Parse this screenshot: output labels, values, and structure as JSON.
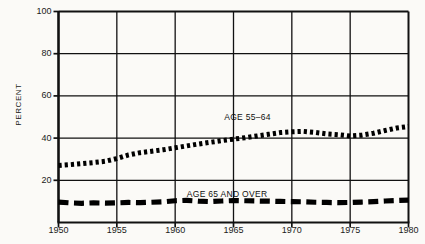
{
  "chart_data": {
    "type": "line",
    "title": "",
    "subtitle": "",
    "xlabel": "",
    "ylabel": "PERCENT",
    "xlim": [
      1950,
      1980
    ],
    "ylim": [
      0,
      100
    ],
    "grid": true,
    "legend_position": "inline-annotation",
    "y_ticks": [
      20,
      40,
      60,
      80,
      100
    ],
    "y_tick_labels": [
      "20",
      "40",
      "60",
      "80",
      "100"
    ],
    "x_ticks": [
      1950,
      1955,
      1960,
      1965,
      1970,
      1975,
      1980
    ],
    "x_tick_labels": [
      "1950",
      "1955",
      "1960",
      "1965",
      "1970",
      "1975",
      "1980"
    ],
    "x": [
      1950,
      1951,
      1952,
      1953,
      1954,
      1955,
      1956,
      1957,
      1958,
      1959,
      1960,
      1961,
      1962,
      1963,
      1964,
      1965,
      1966,
      1967,
      1968,
      1969,
      1970,
      1971,
      1972,
      1973,
      1974,
      1975,
      1976,
      1977,
      1978,
      1979,
      1980
    ],
    "series": [
      {
        "name": "AGE 55-64",
        "style": "dotted",
        "color": "#000000",
        "annotation": "AGE 55–64",
        "values": [
          27.0,
          27.4,
          27.9,
          28.4,
          29.0,
          30.3,
          32.0,
          33.1,
          33.8,
          34.5,
          35.4,
          36.3,
          37.2,
          38.0,
          38.8,
          39.5,
          40.2,
          41.0,
          41.8,
          42.6,
          43.0,
          43.2,
          42.7,
          42.0,
          41.6,
          41.0,
          41.4,
          42.3,
          43.6,
          44.8,
          45.5
        ]
      },
      {
        "name": "AGE 65 AND OVER",
        "style": "dashed",
        "color": "#000000",
        "annotation": "AGE 65 AND OVER",
        "values": [
          9.7,
          9.3,
          9.1,
          9.3,
          9.2,
          9.3,
          9.5,
          9.4,
          9.6,
          9.8,
          10.3,
          10.5,
          10.1,
          9.9,
          10.2,
          10.4,
          10.3,
          10.2,
          10.1,
          10.0,
          9.9,
          9.8,
          9.6,
          9.5,
          9.4,
          9.5,
          9.7,
          9.9,
          10.2,
          10.4,
          10.6
        ]
      }
    ]
  },
  "annotations": {
    "series1_label": "AGE 55–64",
    "series2_label": "AGE 65 AND OVER"
  },
  "axis": {
    "y_title": "PERCENT"
  }
}
